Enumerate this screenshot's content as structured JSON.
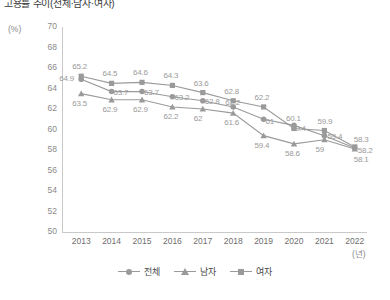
{
  "title": "고용률 추이(전체·남자·여자)",
  "axis": {
    "y_unit": "(%)",
    "x_unit": "(년)"
  },
  "legend": {
    "items": [
      {
        "label": "전체",
        "marker": "circle-marker-icon",
        "color": "#9a9a9a"
      },
      {
        "label": "남자",
        "marker": "triangle-marker-icon",
        "color": "#9a9a9a"
      },
      {
        "label": "여자",
        "marker": "square-marker-icon",
        "color": "#9a9a9a"
      }
    ]
  },
  "chart_data": {
    "type": "line",
    "title": "고용률 추이(전체·남자·여자)",
    "xlabel": "(년)",
    "ylabel": "(%)",
    "ylim": [
      50,
      70
    ],
    "ytick_step": 2,
    "yticks": [
      "70",
      "68",
      "66",
      "64",
      "62",
      "60",
      "58",
      "56",
      "54",
      "52",
      "50"
    ],
    "grid": false,
    "legend_position": "bottom-center",
    "categories": [
      "2013",
      "2014",
      "2015",
      "2016",
      "2017",
      "2018",
      "2019",
      "2020",
      "2021",
      "2022"
    ],
    "series": [
      {
        "name": "남자",
        "marker": "square",
        "color": "#9a9a9a",
        "values": [
          65.2,
          64.5,
          64.6,
          64.3,
          63.6,
          62.8,
          62.2,
          60.1,
          59.9,
          58.3
        ],
        "labels": [
          "65.2",
          "64.5",
          "64.6",
          "64.3",
          "63.6",
          "62.8",
          "62.2",
          "60.1",
          "59.9",
          "58.3"
        ]
      },
      {
        "name": "전체",
        "marker": "circle",
        "color": "#9a9a9a",
        "values": [
          64.9,
          63.7,
          63.7,
          63.2,
          62.8,
          62.2,
          61.0,
          60.4,
          59.4,
          58.2
        ],
        "labels": [
          "64.9",
          "63.7",
          "63.7",
          "63.2",
          "62.8",
          "62.2",
          "61",
          "60.4",
          "59.4",
          "58.2"
        ]
      },
      {
        "name": "여자",
        "marker": "triangle",
        "color": "#9a9a9a",
        "values": [
          63.5,
          62.9,
          62.9,
          62.2,
          62.0,
          61.6,
          59.4,
          58.6,
          59.0,
          58.1
        ],
        "labels": [
          "63.5",
          "62.9",
          "62.9",
          "62.2",
          "62",
          "61.6",
          "59.4",
          "58.6",
          "59",
          "58.1"
        ]
      }
    ]
  }
}
